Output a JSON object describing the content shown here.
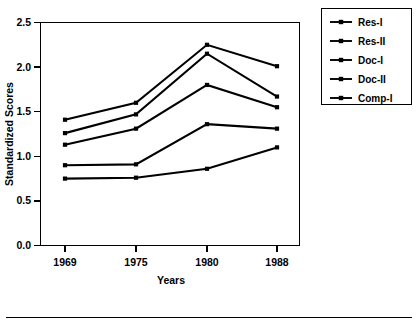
{
  "chart_data": {
    "type": "line",
    "title": "",
    "xlabel": "Years",
    "ylabel": "Standardized Scores",
    "categories": [
      "1969",
      "1975",
      "1980",
      "1988"
    ],
    "ylim": [
      0.0,
      2.5
    ],
    "ytick_labels": [
      "0.0",
      "0.5",
      "1.0",
      "1.5",
      "2.0",
      "2.5"
    ],
    "ytick_values": [
      0.0,
      0.5,
      1.0,
      1.5,
      2.0,
      2.5
    ],
    "grid": false,
    "legend_position": "right-outside",
    "marker": "square",
    "series": [
      {
        "name": "Res-I",
        "values": [
          1.41,
          1.6,
          2.25,
          2.01
        ]
      },
      {
        "name": "Res-II",
        "values": [
          1.26,
          1.47,
          2.15,
          1.67
        ]
      },
      {
        "name": "Doc-I",
        "values": [
          1.13,
          1.31,
          1.8,
          1.55
        ]
      },
      {
        "name": "Doc-II",
        "values": [
          0.9,
          0.91,
          1.36,
          1.31
        ]
      },
      {
        "name": "Comp-I",
        "values": [
          0.75,
          0.76,
          0.86,
          1.1
        ]
      }
    ]
  },
  "legend": {
    "entries": [
      "Res-I",
      "Res-II",
      "Doc-I",
      "Doc-II",
      "Comp-I"
    ]
  },
  "axes": {
    "y_title": "Standardized Scores",
    "x_title": "Years",
    "y_ticks": [
      "2.5",
      "2.0",
      "1.5",
      "1.0",
      "0.5",
      "0.0"
    ],
    "x_ticks": [
      "1969",
      "1975",
      "1980",
      "1988"
    ]
  }
}
